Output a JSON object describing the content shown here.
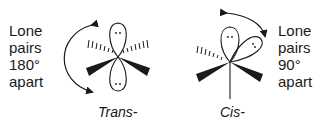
{
  "trans": {
    "label_lines": [
      "Lone",
      "pairs",
      "180°",
      "apart"
    ],
    "caption": "Trans-",
    "angle": "180°"
  },
  "cis": {
    "label_lines": [
      "Lone",
      "pairs",
      "90°",
      "apart"
    ],
    "caption": "Cis-",
    "angle": "90°"
  },
  "colors": {
    "ink": "#1a1a1a",
    "background": "#ffffff"
  }
}
